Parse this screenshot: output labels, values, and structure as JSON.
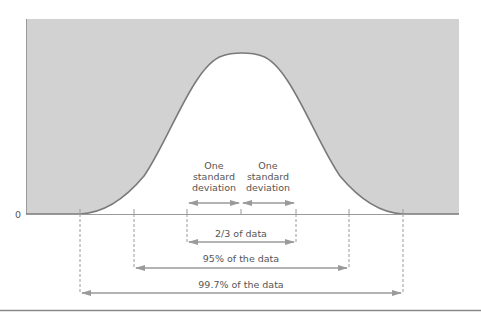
{
  "diagram": {
    "type": "normal-distribution",
    "y_axis_label": "0",
    "colors": {
      "background": "#ffffff",
      "shaded_area": "#d2d2d2",
      "curve": "#7a7a7a",
      "lines": "#9a9a9a",
      "text": "#555555"
    },
    "sd_labels": {
      "left": [
        "One",
        "standard",
        "deviation"
      ],
      "right": [
        "One",
        "standard",
        "deviation"
      ]
    },
    "ranges": [
      {
        "label": "2/3 of data",
        "sigma": 1
      },
      {
        "label": "95% of the data",
        "sigma": 2
      },
      {
        "label": "99.7% of the data",
        "sigma": 3
      }
    ]
  }
}
